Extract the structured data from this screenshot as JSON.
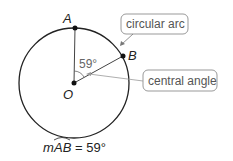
{
  "diagram": {
    "points": {
      "A": "A",
      "B": "B",
      "O": "O"
    },
    "angle_label": "59°",
    "callouts": {
      "arc": "circular arc",
      "angle": "central angle"
    },
    "caption": {
      "prefix": "m",
      "arc": "AB",
      "equals": "= 59°"
    }
  }
}
